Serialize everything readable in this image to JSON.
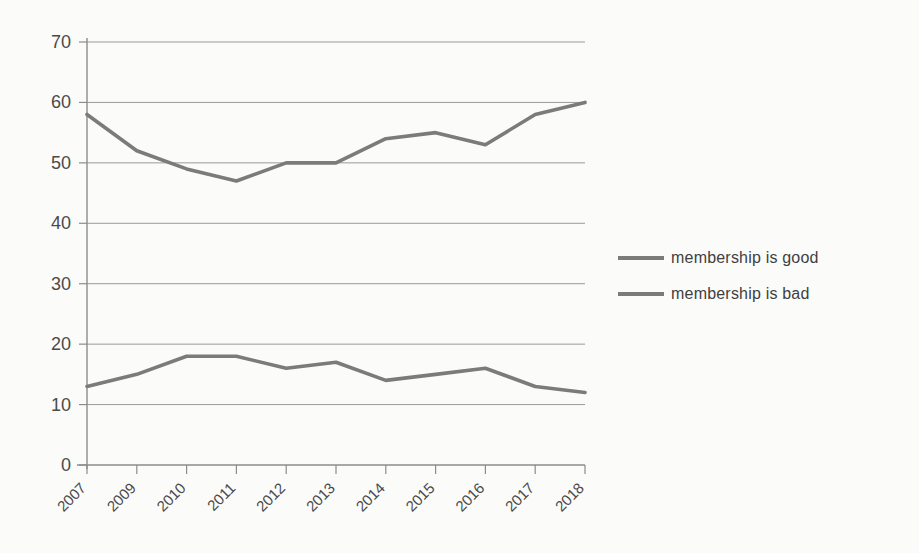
{
  "chart_data": {
    "type": "line",
    "title": "",
    "xlabel": "",
    "ylabel": "",
    "categories": [
      "2007",
      "2009",
      "2010",
      "2011",
      "2012",
      "2013",
      "2014",
      "2015",
      "2016",
      "2017",
      "2018"
    ],
    "series": [
      {
        "name": "membership is good",
        "values": [
          58,
          52,
          49,
          47,
          50,
          50,
          54,
          55,
          53,
          58,
          60
        ],
        "color": "#7b7b7b"
      },
      {
        "name": "membership is bad",
        "values": [
          13,
          15,
          18,
          18,
          16,
          17,
          14,
          15,
          16,
          13,
          12
        ],
        "color": "#7b7b7b"
      }
    ],
    "ylim": [
      0,
      70
    ],
    "yticks": [
      0,
      10,
      20,
      30,
      40,
      50,
      60,
      70
    ],
    "ytick_labels": [
      "0",
      "10",
      "20",
      "30",
      "40",
      "50",
      "60",
      "70"
    ],
    "grid": true,
    "grid_axis": "y",
    "grid_color": "#9a9a9a",
    "axis_color": "#8c8c8c",
    "legend_position": "right",
    "legend_entries": [
      "membership is good",
      "membership is bad"
    ],
    "xtick_rotation": -45
  }
}
